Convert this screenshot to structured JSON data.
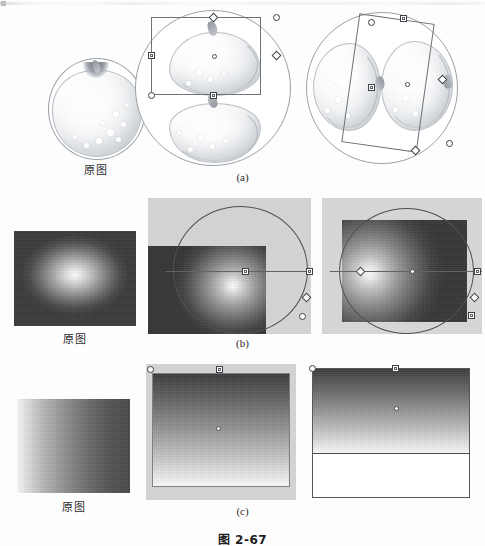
{
  "figure": {
    "number": "图 2-67",
    "caption_bottom": "图 2-67"
  },
  "rows": [
    {
      "id": "a",
      "row_label": "(a)",
      "original_label": "原图",
      "subject": "apple-illustration",
      "panels": [
        {
          "name": "original",
          "label": "原图",
          "description": "circular apple illustration, original"
        },
        {
          "name": "transformed-mirror",
          "label": "",
          "description": "apple pattern mirrored vertically with rectangular transform box and handles"
        },
        {
          "name": "transformed-rotated",
          "label": "",
          "description": "apple pattern rotated with tilted transform box and handles"
        }
      ]
    },
    {
      "id": "b",
      "row_label": "(b)",
      "original_label": "原图",
      "subject": "radial-gradient",
      "panels": [
        {
          "name": "original",
          "label": "原图",
          "description": "radial gradient, white center to dark edge"
        },
        {
          "name": "gradient-offset",
          "label": "",
          "description": "radial gradient with highlight moved right, circular gradient guide and handles on gray canvas"
        },
        {
          "name": "gradient-left",
          "label": "",
          "description": "radial gradient with highlight moved left, circular gradient guide and handles on gray canvas"
        }
      ]
    },
    {
      "id": "c",
      "row_label": "(c)",
      "original_label": "原图",
      "subject": "linear-gradient",
      "panels": [
        {
          "name": "original",
          "label": "原图",
          "description": "linear gradient, light left to dark right"
        },
        {
          "name": "gradient-vertical",
          "label": "",
          "description": "vertical linear gradient dark top to light bottom with transform handles"
        },
        {
          "name": "gradient-vertical-clipped",
          "label": "",
          "description": "vertical linear gradient ending early with white fill below and transform handles"
        }
      ]
    }
  ],
  "colors": {
    "page_background": "#fdfdfd",
    "canvas_gray": "#d3d3d3",
    "handle_stroke": "#3c4044",
    "handle_fill": "#ffffff",
    "outline": "#4d5155",
    "text": "#25282c"
  }
}
